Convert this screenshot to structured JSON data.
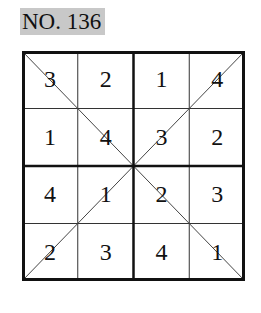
{
  "title": "NO. 136",
  "puzzle": {
    "size": 4,
    "box": 2,
    "diagonals": true,
    "rows": [
      [
        "3",
        "2",
        "1",
        "4"
      ],
      [
        "1",
        "4",
        "3",
        "2"
      ],
      [
        "4",
        "1",
        "2",
        "3"
      ],
      [
        "2",
        "3",
        "4",
        "1"
      ]
    ]
  }
}
